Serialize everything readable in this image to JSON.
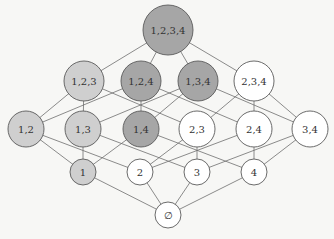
{
  "diagram": {
    "title": "",
    "type": "hasse-diagram",
    "colors": {
      "dark": "#a6a6a6",
      "light": "#cfcfcf",
      "white": "#ffffff",
      "stroke": "#5a5a5a",
      "edge": "#6e6e6e"
    },
    "nodes": [
      {
        "id": "1234",
        "label": "1,2,3,4",
        "x": 168,
        "y": 30,
        "r": 25,
        "fill": "dark",
        "fs": 10
      },
      {
        "id": "123",
        "label": "1,2,3",
        "x": 84,
        "y": 81,
        "r": 20,
        "fill": "light",
        "fs": 10
      },
      {
        "id": "124",
        "label": "1,2,4",
        "x": 141,
        "y": 81,
        "r": 20,
        "fill": "dark",
        "fs": 10
      },
      {
        "id": "134",
        "label": "1,3,4",
        "x": 198,
        "y": 81,
        "r": 20,
        "fill": "dark",
        "fs": 10
      },
      {
        "id": "234",
        "label": "2,3,4",
        "x": 254,
        "y": 81,
        "r": 20,
        "fill": "white",
        "fs": 10
      },
      {
        "id": "12",
        "label": "1,2",
        "x": 26,
        "y": 129,
        "r": 18,
        "fill": "light",
        "fs": 10
      },
      {
        "id": "13",
        "label": "1,3",
        "x": 83,
        "y": 129,
        "r": 18,
        "fill": "light",
        "fs": 10
      },
      {
        "id": "14",
        "label": "1,4",
        "x": 141,
        "y": 129,
        "r": 18,
        "fill": "dark",
        "fs": 10
      },
      {
        "id": "23",
        "label": "2,3",
        "x": 197,
        "y": 129,
        "r": 18,
        "fill": "white",
        "fs": 10
      },
      {
        "id": "24",
        "label": "2,4",
        "x": 254,
        "y": 129,
        "r": 18,
        "fill": "white",
        "fs": 10
      },
      {
        "id": "34",
        "label": "3,4",
        "x": 310,
        "y": 129,
        "r": 18,
        "fill": "white",
        "fs": 10
      },
      {
        "id": "1",
        "label": "1",
        "x": 83,
        "y": 172,
        "r": 13,
        "fill": "light",
        "fs": 10
      },
      {
        "id": "2",
        "label": "2",
        "x": 140,
        "y": 172,
        "r": 13,
        "fill": "white",
        "fs": 10
      },
      {
        "id": "3",
        "label": "3",
        "x": 197,
        "y": 172,
        "r": 13,
        "fill": "white",
        "fs": 10
      },
      {
        "id": "4",
        "label": "4",
        "x": 254,
        "y": 172,
        "r": 13,
        "fill": "white",
        "fs": 10
      },
      {
        "id": "empty",
        "label": "∅",
        "x": 168,
        "y": 215,
        "r": 13,
        "fill": "white",
        "fs": 10
      }
    ],
    "edges": [
      [
        "1234",
        "123"
      ],
      [
        "1234",
        "124"
      ],
      [
        "1234",
        "134"
      ],
      [
        "1234",
        "234"
      ],
      [
        "123",
        "12"
      ],
      [
        "123",
        "13"
      ],
      [
        "123",
        "23"
      ],
      [
        "124",
        "12"
      ],
      [
        "124",
        "14"
      ],
      [
        "124",
        "24"
      ],
      [
        "134",
        "13"
      ],
      [
        "134",
        "14"
      ],
      [
        "134",
        "34"
      ],
      [
        "234",
        "23"
      ],
      [
        "234",
        "24"
      ],
      [
        "234",
        "34"
      ],
      [
        "12",
        "1"
      ],
      [
        "12",
        "2"
      ],
      [
        "13",
        "1"
      ],
      [
        "13",
        "3"
      ],
      [
        "14",
        "1"
      ],
      [
        "14",
        "4"
      ],
      [
        "23",
        "2"
      ],
      [
        "23",
        "3"
      ],
      [
        "24",
        "2"
      ],
      [
        "24",
        "4"
      ],
      [
        "34",
        "3"
      ],
      [
        "34",
        "4"
      ],
      [
        "1",
        "empty"
      ],
      [
        "2",
        "empty"
      ],
      [
        "3",
        "empty"
      ],
      [
        "4",
        "empty"
      ]
    ]
  }
}
